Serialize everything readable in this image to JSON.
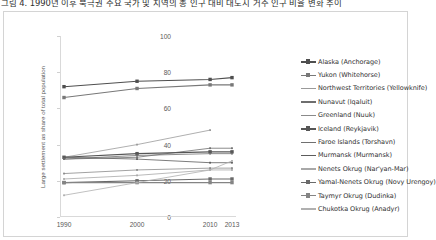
{
  "caption": {
    "text": "그림 4. 1990년 이후 북극권 주요 국가 및 지역의 총 인구 대비 대도시 거주 인구 비율 변화 추이"
  },
  "chart_data": {
    "type": "line",
    "title": "",
    "xlabel": "",
    "ylabel": "Large settlement as share of total population",
    "x": [
      1990,
      2000,
      2010,
      2013
    ],
    "xtick_labels": [
      "1990",
      "2000",
      "2010",
      "2013"
    ],
    "ytick_labels": [
      "0",
      "20",
      "40",
      "60",
      "80",
      "100"
    ],
    "yticks": [
      0,
      20,
      40,
      60,
      80,
      100
    ],
    "ylim": [
      0,
      100
    ],
    "grid": false,
    "legend_position": "right",
    "series": [
      {
        "name": "Alaska (Anchorage)",
        "color": "#4f4f4f",
        "marker": "square",
        "x": [
          1990,
          2000,
          2010,
          2013
        ],
        "values": [
          72,
          75,
          76,
          77
        ]
      },
      {
        "name": "Yukon (Whitehorse)",
        "color": "#787878",
        "marker": "square",
        "x": [
          1990,
          2000,
          2010,
          2013
        ],
        "values": [
          66,
          71,
          73,
          73
        ]
      },
      {
        "name": "Northwest Territories (Yellowknife)",
        "color": "#9a9a9a",
        "marker": "none",
        "x": [
          1990,
          2000,
          2010
        ],
        "values": [
          33,
          40,
          48
        ]
      },
      {
        "name": "Nunavut (Iqaluit)",
        "color": "#6e6e6e",
        "marker": "none",
        "x": [
          1990,
          2000,
          2010,
          2013
        ],
        "values": [
          32,
          33,
          38,
          38
        ]
      },
      {
        "name": "Greenland (Nuuk)",
        "color": "#8a8a8a",
        "marker": "none",
        "x": [
          1990,
          2000,
          2010,
          2013
        ],
        "values": [
          24,
          26,
          27,
          27
        ]
      },
      {
        "name": "Iceland (Reykjavik)",
        "color": "#565656",
        "marker": "square",
        "x": [
          1990,
          2000,
          2010,
          2013
        ],
        "values": [
          33,
          35,
          36,
          36
        ]
      },
      {
        "name": "Faroe Islands (Torshavn)",
        "color": "#707070",
        "marker": "none",
        "x": [
          1990,
          2000,
          2010,
          2013
        ],
        "values": [
          32,
          34,
          35,
          35
        ]
      },
      {
        "name": "Murmansk (Murmansk)",
        "color": "#5c5c5c",
        "marker": "none",
        "x": [
          1990,
          2000,
          2010,
          2013
        ],
        "values": [
          33,
          32,
          30,
          30
        ]
      },
      {
        "name": "Nenets Okrug (Nar'yan-Mar)",
        "color": "#a8a8a8",
        "marker": "none",
        "x": [
          1990,
          2000,
          2010,
          2013
        ],
        "values": [
          21,
          23,
          26,
          26
        ]
      },
      {
        "name": "Yamal-Nenets Okrug (Novy Urengoy)",
        "color": "#6a6a6a",
        "marker": "square",
        "x": [
          1990,
          2000,
          2010,
          2013
        ],
        "values": [
          19,
          20,
          21,
          21
        ]
      },
      {
        "name": "Taymyr Okrug (Dudinka)",
        "color": "#848484",
        "marker": "square",
        "x": [
          1990,
          2000,
          2010,
          2013
        ],
        "values": [
          19,
          19,
          19,
          19
        ]
      },
      {
        "name": "Chukotka Okrug (Anadyr)",
        "color": "#b0b0b0",
        "marker": "none",
        "x": [
          1990,
          2000,
          2010,
          2013
        ],
        "values": [
          12,
          19,
          26,
          31
        ]
      }
    ]
  }
}
